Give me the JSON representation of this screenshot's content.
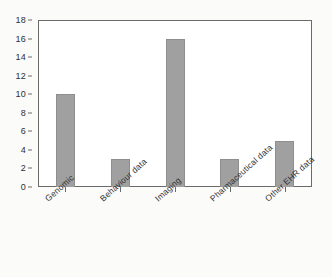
{
  "chart_data": {
    "type": "bar",
    "title": "",
    "xlabel": "",
    "ylabel": "",
    "categories": [
      "Genomic",
      "Behaviour data",
      "Imaging",
      "Pharmaceutical data",
      "Other EHR data"
    ],
    "values": [
      10,
      3,
      16,
      3,
      5
    ],
    "ylim": [
      0,
      18
    ],
    "ytick_step": 2,
    "yticks": [
      18,
      16,
      14,
      12,
      10,
      8,
      6,
      4,
      2,
      0
    ],
    "grid": false,
    "legend": false,
    "legend_position": "none",
    "bar_color": "#a0a0a0",
    "bar_edge_color": "#8e8e8e",
    "axis_color": "#6a6a6a",
    "text_color": "#2f2f2f",
    "background_color": "#fbfbfa",
    "plot_background_color": "#ffffff",
    "xlabel_rotation_degrees": -42
  }
}
